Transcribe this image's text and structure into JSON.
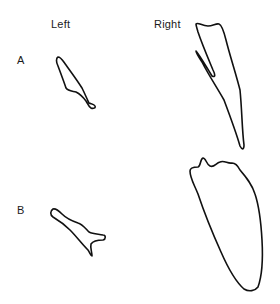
{
  "columns": {
    "left": "Left",
    "right": "Right"
  },
  "rows": {
    "a": "A",
    "b": "B"
  },
  "outlines": [
    {
      "row": "A",
      "side": "Left",
      "shape": "narrow-elongated"
    },
    {
      "row": "A",
      "side": "Right",
      "shape": "elongated-notched"
    },
    {
      "row": "B",
      "side": "Left",
      "shape": "forked"
    },
    {
      "row": "B",
      "side": "Right",
      "shape": "broad-lobed"
    }
  ],
  "colors": {
    "stroke": "#111111",
    "background": "#ffffff"
  }
}
